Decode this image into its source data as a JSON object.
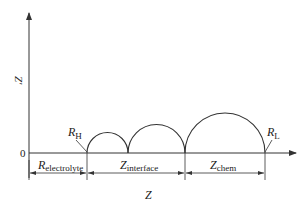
{
  "diagram": {
    "type": "nyquist-impedance-schematic",
    "axes": {
      "x_label": "Z",
      "y_label": "Z'",
      "origin_label": "0"
    },
    "points": {
      "rh": {
        "base": "R",
        "sub": "H"
      },
      "rl": {
        "base": "R",
        "sub": "L"
      }
    },
    "segments": [
      {
        "base": "R",
        "sub": "electrolyte"
      },
      {
        "base": "Z",
        "sub": "interface"
      },
      {
        "base": "Z",
        "sub": "chem"
      }
    ],
    "arcs": [
      {
        "start_x": 87,
        "end_x": 128
      },
      {
        "start_x": 128,
        "end_x": 185
      },
      {
        "start_x": 185,
        "end_x": 265
      }
    ],
    "colors": {
      "stroke": "#333333",
      "text": "#222222",
      "background": "#ffffff"
    }
  }
}
